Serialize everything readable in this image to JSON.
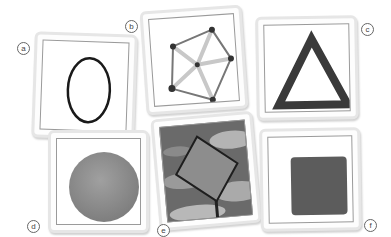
{
  "figure": {
    "panels": [
      {
        "label": "a",
        "shape": "oval-outline",
        "color": "#1a1a1a"
      },
      {
        "label": "b",
        "shape": "pentagon-star-sticks",
        "color": "#555555"
      },
      {
        "label": "c",
        "shape": "triangle-outline",
        "color": "#3a3a3a"
      },
      {
        "label": "d",
        "shape": "filled-circle",
        "color": "#8f8f8f"
      },
      {
        "label": "e",
        "shape": "diamond-sign-sky-photo",
        "color": "#7a7a7a"
      },
      {
        "label": "f",
        "shape": "filled-square-texture",
        "color": "#5c5c5c"
      }
    ]
  }
}
